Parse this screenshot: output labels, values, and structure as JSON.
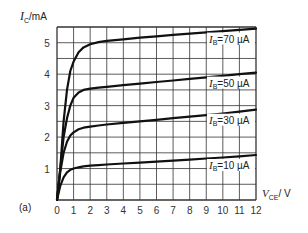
{
  "chart_data": {
    "type": "line",
    "title": "",
    "panel_label": "(a)",
    "xlabel": "V_CE / V",
    "ylabel": "I_C / mA",
    "xlim": [
      0,
      12
    ],
    "ylim": [
      0,
      5.5
    ],
    "grid": true,
    "x_ticks": [
      0,
      1,
      2,
      3,
      4,
      5,
      6,
      7,
      8,
      9,
      10,
      11,
      12
    ],
    "y_ticks": [
      1,
      2,
      3,
      4,
      5
    ],
    "series": [
      {
        "name": "I_B = 70 µA",
        "label_main": "I",
        "label_sub": "B",
        "label_rest": "=70 µA",
        "x": [
          0,
          0.2,
          0.4,
          0.6,
          0.8,
          1.0,
          1.3,
          1.6,
          2.0,
          2.5,
          3,
          4,
          5,
          6,
          7,
          8,
          9,
          10,
          11,
          12
        ],
        "y": [
          0,
          1.0,
          2.5,
          3.5,
          4.1,
          4.4,
          4.7,
          4.85,
          4.95,
          5.02,
          5.06,
          5.11,
          5.16,
          5.2,
          5.25,
          5.29,
          5.33,
          5.37,
          5.41,
          5.45
        ]
      },
      {
        "name": "I_B = 50 µA",
        "label_main": "I",
        "label_sub": "B",
        "label_rest": "=50 µA",
        "x": [
          0,
          0.2,
          0.4,
          0.6,
          0.8,
          1.0,
          1.3,
          1.6,
          2.0,
          2.5,
          3,
          4,
          5,
          6,
          7,
          8,
          9,
          10,
          11,
          12
        ],
        "y": [
          0,
          1.0,
          2.0,
          2.6,
          3.0,
          3.25,
          3.42,
          3.5,
          3.54,
          3.57,
          3.6,
          3.65,
          3.7,
          3.75,
          3.8,
          3.85,
          3.9,
          3.95,
          4.0,
          4.05
        ]
      },
      {
        "name": "I_B = 30 µA",
        "label_main": "I",
        "label_sub": "B",
        "label_rest": "=30 µA",
        "x": [
          0,
          0.2,
          0.4,
          0.6,
          0.8,
          1.0,
          1.3,
          1.6,
          2.0,
          2.5,
          3,
          4,
          5,
          6,
          7,
          8,
          9,
          10,
          11,
          12
        ],
        "y": [
          0,
          0.9,
          1.5,
          1.85,
          2.05,
          2.15,
          2.25,
          2.3,
          2.33,
          2.37,
          2.4,
          2.45,
          2.5,
          2.55,
          2.6,
          2.65,
          2.7,
          2.75,
          2.81,
          2.87
        ]
      },
      {
        "name": "I_B = 10 µA",
        "label_main": "I",
        "label_sub": "B",
        "label_rest": "=10 µA",
        "x": [
          0,
          0.2,
          0.4,
          0.6,
          0.8,
          1.0,
          1.3,
          1.6,
          2.0,
          2.5,
          3,
          4,
          5,
          6,
          7,
          8,
          9,
          10,
          11,
          12
        ],
        "y": [
          0,
          0.45,
          0.72,
          0.88,
          0.96,
          1.0,
          1.04,
          1.07,
          1.09,
          1.11,
          1.13,
          1.16,
          1.19,
          1.22,
          1.25,
          1.28,
          1.32,
          1.35,
          1.39,
          1.43
        ]
      }
    ]
  },
  "labels": {
    "y_axis_main": "I",
    "y_axis_sub": "C",
    "y_axis_unit": "/mA",
    "x_axis_main": "V",
    "x_axis_sub": "CE",
    "x_axis_unit": "/ V",
    "panel": "(a)",
    "origin": "0"
  },
  "style": {
    "curve_color": "#111111",
    "grid_color": "#333333",
    "background": "#ffffff"
  }
}
